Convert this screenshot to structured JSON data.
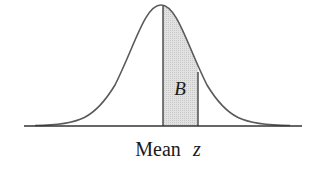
{
  "diagram": {
    "type": "normal-distribution-shaded-area",
    "region_label": "B",
    "axis_labels": {
      "mean": "Mean",
      "z": "z"
    },
    "colors": {
      "curve": "#555555",
      "shade": "#d9d9d9",
      "axis": "#333333",
      "text": "#1a1a1a"
    }
  }
}
